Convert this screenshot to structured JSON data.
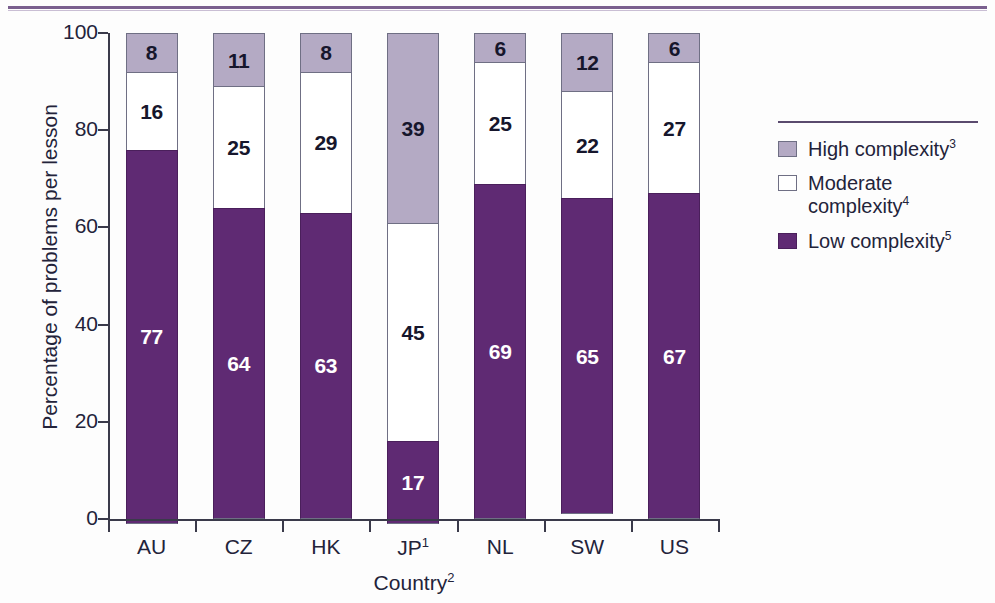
{
  "chart_data": {
    "type": "bar",
    "subtype": "stacked-100-percent",
    "title": "",
    "xlabel": "Country",
    "xlabel_footnote": "2",
    "ylabel": "Percentage of problems per lesson",
    "ylim": [
      0,
      100
    ],
    "yticks": [
      0,
      20,
      40,
      60,
      80,
      100
    ],
    "grid": false,
    "legend_position": "right",
    "categories": [
      "AU",
      "CZ",
      "HK",
      "JP",
      "NL",
      "SW",
      "US"
    ],
    "category_footnotes": [
      "",
      "",
      "",
      "1",
      "",
      "",
      ""
    ],
    "series": [
      {
        "name": "High complexity",
        "footnote": "3",
        "color": "#b4aac4",
        "values": [
          8,
          11,
          8,
          39,
          6,
          12,
          6
        ]
      },
      {
        "name": "Moderate complexity",
        "footnote": "4",
        "color": "#ffffff",
        "values": [
          16,
          25,
          29,
          45,
          25,
          22,
          27
        ]
      },
      {
        "name": "Low complexity",
        "footnote": "5",
        "color": "#5f2a73",
        "values": [
          77,
          64,
          63,
          17,
          69,
          65,
          67
        ]
      }
    ]
  },
  "axis": {
    "y_tick_labels": [
      "0",
      "20",
      "40",
      "60",
      "80",
      "100"
    ],
    "y_title": "Percentage of problems per lesson",
    "x_title": "Country",
    "x_title_sup": "2",
    "x_tick_labels": [
      "AU",
      "CZ",
      "HK",
      "JP",
      "NL",
      "SW",
      "US"
    ],
    "x_tick_sups": [
      "",
      "",
      "",
      "1",
      "",
      "",
      ""
    ]
  },
  "legend": {
    "items": [
      {
        "label": "High complexity",
        "sup": "3",
        "swatch": "sw-high"
      },
      {
        "label": "Moderate complexity",
        "sup": "4",
        "swatch": "sw-mod"
      },
      {
        "label": "Low complexity",
        "sup": "5",
        "swatch": "sw-low"
      }
    ]
  },
  "values_display": {
    "AU": {
      "high": "8",
      "mod": "16",
      "low": "77"
    },
    "CZ": {
      "high": "11",
      "mod": "25",
      "low": "64"
    },
    "HK": {
      "high": "8",
      "mod": "29",
      "low": "63"
    },
    "JP": {
      "high": "39",
      "mod": "45",
      "low": "17"
    },
    "NL": {
      "high": "6",
      "mod": "25",
      "low": "69"
    },
    "SW": {
      "high": "12",
      "mod": "22",
      "low": "65"
    },
    "US": {
      "high": "6",
      "mod": "27",
      "low": "67"
    }
  },
  "colors": {
    "high": "#b4aac4",
    "moderate": "#ffffff",
    "low": "#5f2a73",
    "rule": "#7a5f8e",
    "axis": "#3a3a4a"
  }
}
